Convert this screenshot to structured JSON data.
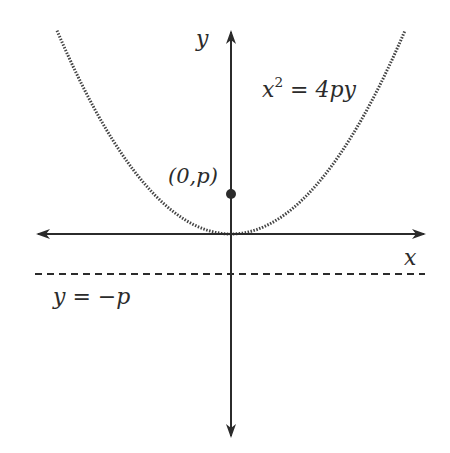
{
  "diagram": {
    "type": "parabola",
    "equation": {
      "base": "x",
      "exponent": "2",
      "rest": " = 4py"
    },
    "focus_label": "(0,p)",
    "directrix_label": "y = −p",
    "axis_labels": {
      "x": "x",
      "y": "y"
    },
    "colors": {
      "ink": "#2b2b2b",
      "curve": "#555555",
      "background": "#ffffff"
    }
  }
}
